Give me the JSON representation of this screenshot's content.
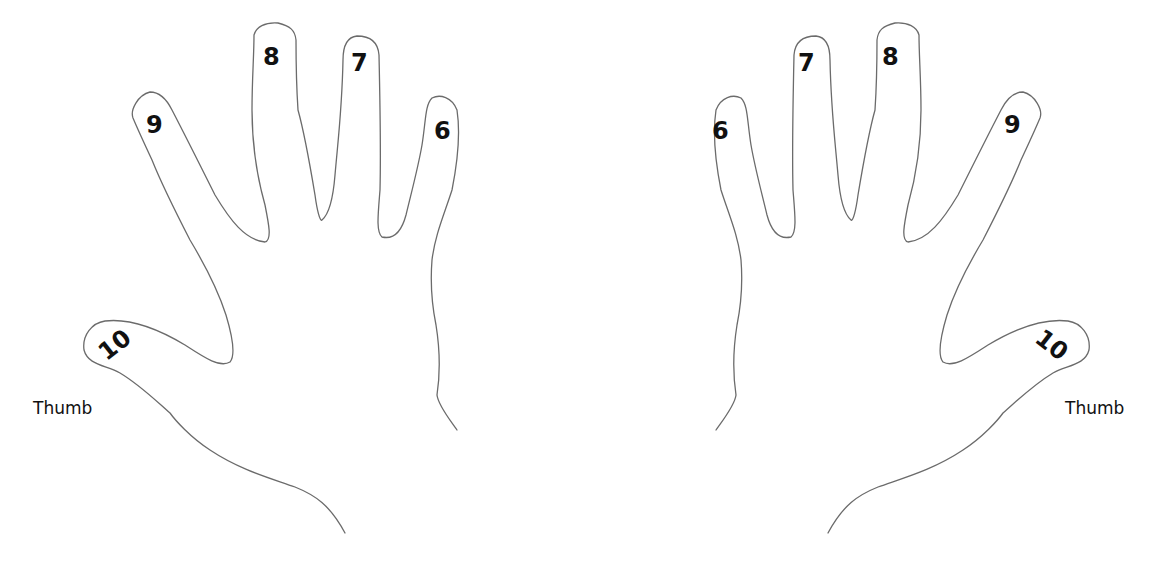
{
  "left_hand": {
    "fingers": [
      {
        "label": "10",
        "name": "thumb"
      },
      {
        "label": "9",
        "name": "index"
      },
      {
        "label": "8",
        "name": "middle"
      },
      {
        "label": "7",
        "name": "ring"
      },
      {
        "label": "6",
        "name": "pinky"
      }
    ],
    "thumb_caption": "Thumb"
  },
  "right_hand": {
    "fingers": [
      {
        "label": "6",
        "name": "pinky"
      },
      {
        "label": "7",
        "name": "ring"
      },
      {
        "label": "8",
        "name": "middle"
      },
      {
        "label": "9",
        "name": "index"
      },
      {
        "label": "10",
        "name": "thumb"
      }
    ],
    "thumb_caption": "Thumb"
  },
  "colors": {
    "outline": "#6b6b6b",
    "text": "#111111",
    "background": "#ffffff"
  }
}
